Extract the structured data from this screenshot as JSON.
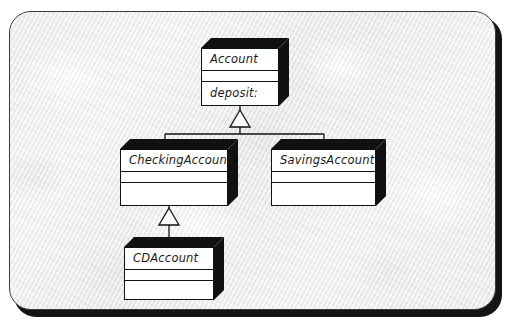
{
  "diagram": {
    "kind": "uml-class-diagram",
    "frame": {
      "background_color": "#f1f1f1",
      "border_color": "#3a3a3a",
      "shadow_color": "#141414"
    },
    "style": {
      "box_fill": "#ffffff",
      "box_stroke": "#111111",
      "extrusion_fill": "#111111",
      "text_color": "#1a1a1a"
    },
    "classes": [
      {
        "id": "account",
        "name": "Account",
        "attributes": [],
        "operations": [
          "deposit:"
        ],
        "x": 201,
        "y": 38,
        "width": 78,
        "height": 58,
        "name_band_height": 22,
        "mid_band_height": 11,
        "depth": 10
      },
      {
        "id": "checking-account",
        "name": "CheckingAccount",
        "attributes": [],
        "operations": [],
        "x": 120,
        "y": 139,
        "width": 108,
        "height": 57,
        "name_band_height": 22,
        "mid_band_height": 11,
        "depth": 10
      },
      {
        "id": "savings-account",
        "name": "SavingsAccount",
        "attributes": [],
        "operations": [],
        "x": 271,
        "y": 139,
        "width": 105,
        "height": 57,
        "name_band_height": 22,
        "mid_band_height": 11,
        "depth": 10
      },
      {
        "id": "cd-account",
        "name": "CDAccount",
        "attributes": [],
        "operations": [],
        "x": 124,
        "y": 237,
        "width": 90,
        "height": 53,
        "name_band_height": 22,
        "mid_band_height": 11,
        "depth": 10
      }
    ],
    "relationships": [
      {
        "id": "checking-inherits-account",
        "type": "generalization",
        "label": "inherits",
        "from": "checking-account",
        "to": "account"
      },
      {
        "id": "savings-inherits-account",
        "type": "generalization",
        "label": "inherits",
        "from": "savings-account",
        "to": "account"
      },
      {
        "id": "cd-inherits-checking",
        "type": "generalization",
        "label": "inherits",
        "from": "cd-account",
        "to": "checking-account"
      }
    ]
  }
}
